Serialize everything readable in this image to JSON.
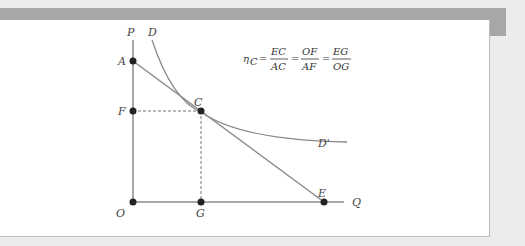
{
  "diagram": {
    "axes": {
      "y_label": "P",
      "x_label": "Q",
      "origin_label": "O"
    },
    "curve": {
      "start_label": "D",
      "end_label": "D'"
    },
    "points": {
      "A": "A",
      "F": "F",
      "C": "C",
      "G": "G",
      "E": "E",
      "O": "O"
    },
    "formula": {
      "lhs": "η",
      "lhs_sub": "C",
      "eq": "=",
      "f1_num": "EC",
      "f1_den": "AC",
      "f2_num": "OF",
      "f2_den": "AF",
      "f3_num": "EG",
      "f3_den": "OG"
    }
  },
  "colors": {
    "line": "#8a8a8a",
    "dot": "#222222",
    "frame": "#a7a7a7",
    "bg": "#ececec"
  }
}
